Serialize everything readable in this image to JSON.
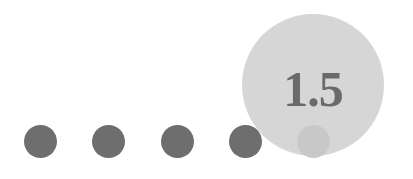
{
  "slider": {
    "value": "1.5",
    "steps": 5,
    "selected_index": 4,
    "colors": {
      "dot": "#6e6e6e",
      "bubble": "#d6d6d6",
      "thumb": "#c8c8c8",
      "value_text": "#6a6a6a"
    }
  }
}
